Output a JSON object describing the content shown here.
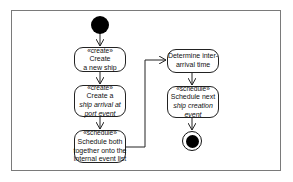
{
  "diagram": {
    "type": "UML activity diagram",
    "colors": {
      "line": "#222222",
      "frame": "#7a7a7a",
      "fill": "#ffffff",
      "node": "#000000"
    },
    "initial_node": {
      "label": ""
    },
    "activities": [
      {
        "id": "a1",
        "stereotype": "«create»",
        "lines": [
          "Create",
          "a new ship"
        ]
      },
      {
        "id": "a2",
        "stereotype": "«create»",
        "lines": [
          "Create a",
          "ship arrival at",
          "port event"
        ]
      },
      {
        "id": "a3",
        "stereotype": "«schedule»",
        "lines": [
          "Schedule both",
          "together onto the",
          "internal event list"
        ]
      },
      {
        "id": "a4",
        "stereotype": "",
        "lines": [
          "Determine inter-",
          "arrival time"
        ]
      },
      {
        "id": "a5",
        "stereotype": "«schedule»",
        "lines": [
          "Schedule next",
          "ship creation",
          "event"
        ]
      }
    ],
    "final_node": {
      "label": ""
    },
    "flows": [
      [
        "initial",
        "a1"
      ],
      [
        "a1",
        "a2"
      ],
      [
        "a2",
        "a3"
      ],
      [
        "a3",
        "a4"
      ],
      [
        "a4",
        "a5"
      ],
      [
        "a5",
        "final"
      ]
    ]
  }
}
